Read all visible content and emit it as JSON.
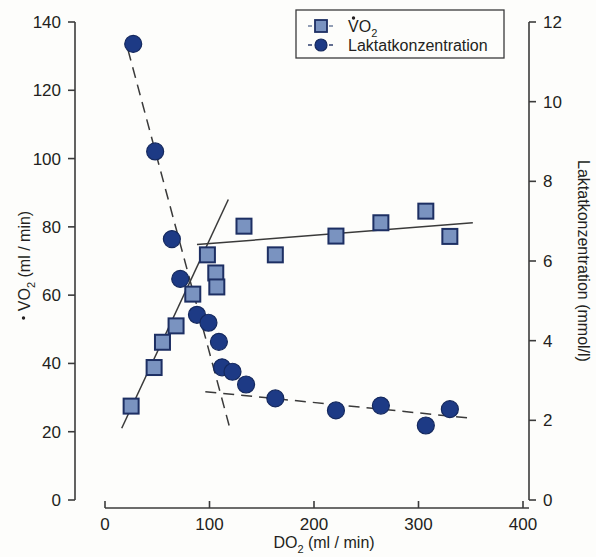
{
  "chart_data": {
    "type": "scatter",
    "title": "",
    "xlabel": "DO2 (ml / min)",
    "xlabel_main": "DO",
    "xlabel_sub": "2",
    "xlabel_unit": " (ml / min)",
    "xlim": [
      0,
      400
    ],
    "xticks": [
      0,
      100,
      200,
      300,
      400
    ],
    "ylabel": "VO2 (ml / min)",
    "ylabel_main": "VO",
    "ylabel_sub": "2",
    "ylabel_unit": " (ml / min)",
    "ylim": [
      0,
      140
    ],
    "yticks": [
      0,
      20,
      40,
      60,
      80,
      100,
      120,
      140
    ],
    "y2label": "Laktatkonzentration (mmol/l)",
    "y2lim": [
      0,
      12
    ],
    "y2ticks": [
      0,
      2,
      4,
      6,
      8,
      10,
      12
    ],
    "grid": false,
    "legend_position": "top-right",
    "series": [
      {
        "name": "VO2",
        "legend_label": "VO2",
        "legend_main": "VO",
        "legend_sub": "2",
        "axis": "left",
        "marker": "square",
        "color": "#7a93c0",
        "edge_color": "#1d2f63",
        "line_style": "solid",
        "points": [
          {
            "x": 25,
            "y": 27.5
          },
          {
            "x": 47,
            "y": 38.8
          },
          {
            "x": 55,
            "y": 46.2
          },
          {
            "x": 68,
            "y": 51.0
          },
          {
            "x": 84,
            "y": 60.3
          },
          {
            "x": 98,
            "y": 71.8
          },
          {
            "x": 106,
            "y": 66.5
          },
          {
            "x": 107,
            "y": 62.4
          },
          {
            "x": 133,
            "y": 80.2
          },
          {
            "x": 163,
            "y": 71.8
          },
          {
            "x": 221,
            "y": 77.3
          },
          {
            "x": 264,
            "y": 81.2
          },
          {
            "x": 307,
            "y": 84.6
          },
          {
            "x": 330,
            "y": 77.2
          }
        ],
        "trend_lines": [
          {
            "x1": 16,
            "y1": 21.0,
            "x2": 118,
            "y2": 88.0
          },
          {
            "x1": 88,
            "y1": 74.8,
            "x2": 352,
            "y2": 81.2
          }
        ]
      },
      {
        "name": "Laktatkonzentration",
        "legend_label": "Laktatkonzentration",
        "axis": "right",
        "marker": "circle",
        "color": "#1d3a85",
        "edge_color": "#15295e",
        "line_style": "dashed",
        "points": [
          {
            "x": 27,
            "y": 11.45
          },
          {
            "x": 48,
            "y": 8.75
          },
          {
            "x": 64,
            "y": 6.55
          },
          {
            "x": 72,
            "y": 5.55
          },
          {
            "x": 88,
            "y": 4.65
          },
          {
            "x": 99,
            "y": 4.45
          },
          {
            "x": 109,
            "y": 3.97
          },
          {
            "x": 112,
            "y": 3.33
          },
          {
            "x": 122,
            "y": 3.22
          },
          {
            "x": 135,
            "y": 2.9
          },
          {
            "x": 163,
            "y": 2.55
          },
          {
            "x": 221,
            "y": 2.25
          },
          {
            "x": 264,
            "y": 2.37
          },
          {
            "x": 307,
            "y": 1.87
          },
          {
            "x": 330,
            "y": 2.28
          }
        ],
        "trend_lines": [
          {
            "x1": 22,
            "y1": 11.3,
            "x2": 120,
            "y2": 1.75
          },
          {
            "x1": 96,
            "y1": 2.72,
            "x2": 352,
            "y2": 2.05
          }
        ]
      }
    ]
  },
  "axes": {
    "left_title_main": "VO",
    "left_title_sub": "2",
    "left_title_unit": " (ml / min)",
    "right_title": "Laktatkonzentration (mmol/l)",
    "bottom_title_main": "DO",
    "bottom_title_sub": "2",
    "bottom_title_unit": " (ml / min)"
  },
  "legend": {
    "items": [
      {
        "label_main": "VO",
        "label_sub": "2",
        "marker": "square"
      },
      {
        "label_main": "Laktatkonzentration",
        "label_sub": "",
        "marker": "circle"
      }
    ]
  },
  "colors": {
    "square_fill": "#7a93c0",
    "square_edge": "#1d2f63",
    "circle_fill": "#1d3a85",
    "axis": "#3b3b3b",
    "text": "#231f20",
    "background": "#fdfdfb"
  }
}
